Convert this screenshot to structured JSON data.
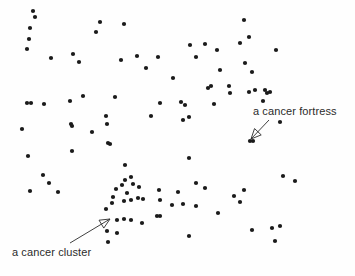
{
  "figure": {
    "background_color": "#fefefe",
    "dot_color": "#1a1a1a",
    "annotation_color": "#2b2b2b",
    "width": 355,
    "height": 276
  },
  "annotations": [
    {
      "id": "cancer-fortress",
      "label": "a cancer fortress",
      "text_x": 253,
      "text_y": 105,
      "arrow": {
        "x1": 269,
        "y1": 120,
        "x2": 251,
        "y2": 139
      }
    },
    {
      "id": "cancer-cluster",
      "label": "a cancer cluster",
      "text_x": 12,
      "text_y": 246,
      "arrow": {
        "x1": 70,
        "y1": 243,
        "x2": 110,
        "y2": 219
      }
    }
  ],
  "chart_data": {
    "type": "scatter",
    "title": "",
    "xlabel": "",
    "ylabel": "",
    "xlim": [
      0,
      355
    ],
    "ylim": [
      0,
      276
    ],
    "grid": false,
    "legend": null,
    "marker": {
      "shape": "circle",
      "radius": 2.1,
      "color": "#1a1a1a"
    },
    "series": [
      {
        "name": "cells",
        "points": [
          [
            33,
            11
          ],
          [
            35,
            17
          ],
          [
            30,
            28
          ],
          [
            29,
            39
          ],
          [
            27,
            49
          ],
          [
            51,
            58
          ],
          [
            73,
            54
          ],
          [
            79,
            62
          ],
          [
            100,
            22
          ],
          [
            96,
            32
          ],
          [
            124,
            24
          ],
          [
            121,
            60
          ],
          [
            137,
            56
          ],
          [
            146,
            68
          ],
          [
            158,
            57
          ],
          [
            173,
            78
          ],
          [
            190,
            45
          ],
          [
            196,
            57
          ],
          [
            217,
            50
          ],
          [
            220,
            70
          ],
          [
            205,
            44
          ],
          [
            249,
            37
          ],
          [
            245,
            63
          ],
          [
            252,
            72
          ],
          [
            230,
            93
          ],
          [
            208,
            88
          ],
          [
            211,
            86
          ],
          [
            240,
            43
          ],
          [
            276,
            50
          ],
          [
            229,
            86
          ],
          [
            83,
            96
          ],
          [
            70,
            101
          ],
          [
            27,
            103
          ],
          [
            31,
            103
          ],
          [
            44,
            104
          ],
          [
            265,
            90
          ],
          [
            244,
            20
          ],
          [
            267,
            93
          ],
          [
            115,
            97
          ],
          [
            160,
            103
          ],
          [
            181,
            102
          ],
          [
            22,
            129
          ],
          [
            71,
            124
          ],
          [
            72,
            126
          ],
          [
            92,
            132
          ],
          [
            106,
            116
          ],
          [
            151,
            116
          ],
          [
            183,
            120
          ],
          [
            185,
            105
          ],
          [
            189,
            117
          ],
          [
            214,
            104
          ],
          [
            253,
            141
          ],
          [
            28,
            156
          ],
          [
            72,
            151
          ],
          [
            107,
            124
          ],
          [
            108,
            143
          ],
          [
            110,
            144
          ],
          [
            189,
            158
          ],
          [
            255,
            90
          ],
          [
            249,
            92
          ],
          [
            125,
            165
          ],
          [
            43,
            175
          ],
          [
            49,
            183
          ],
          [
            58,
            192
          ],
          [
            30,
            191
          ],
          [
            125,
            180
          ],
          [
            116,
            189
          ],
          [
            131,
            177
          ],
          [
            122,
            185
          ],
          [
            133,
            184
          ],
          [
            113,
            197
          ],
          [
            127,
            193
          ],
          [
            139,
            187
          ],
          [
            112,
            203
          ],
          [
            124,
            201
          ],
          [
            131,
            200
          ],
          [
            138,
            198
          ],
          [
            159,
            190
          ],
          [
            143,
            199
          ],
          [
            106,
            209
          ],
          [
            117,
            220
          ],
          [
            124,
            219
          ],
          [
            131,
            220
          ],
          [
            142,
            223
          ],
          [
            107,
            231
          ],
          [
            117,
            233
          ],
          [
            108,
            242
          ],
          [
            157,
            216
          ],
          [
            172,
            205
          ],
          [
            160,
            200
          ],
          [
            196,
            183
          ],
          [
            178,
            192
          ],
          [
            196,
            206
          ],
          [
            160,
            216
          ],
          [
            183,
            204
          ],
          [
            250,
            141
          ],
          [
            280,
            122
          ],
          [
            270,
            92
          ],
          [
            244,
            190
          ],
          [
            263,
            101
          ],
          [
            283,
            176
          ],
          [
            295,
            181
          ],
          [
            189,
            236
          ],
          [
            234,
            196
          ],
          [
            252,
            230
          ],
          [
            272,
            228
          ],
          [
            280,
            226
          ],
          [
            275,
            241
          ],
          [
            240,
            202
          ],
          [
            218,
            213
          ],
          [
            205,
            188
          ]
        ]
      }
    ]
  }
}
